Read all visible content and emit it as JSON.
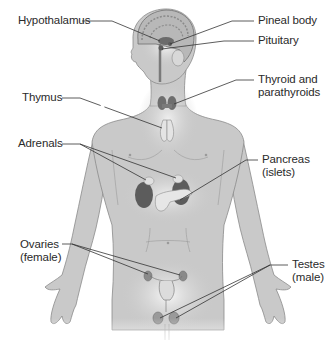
{
  "diagram": {
    "type": "anatomical-illustration",
    "colors": {
      "background": "#ffffff",
      "body_fill": "#c9c9c9",
      "body_stroke": "#8a8a8a",
      "glow": "#f2f2f2",
      "gland_dark": "#5c5c5c",
      "gland_light": "#dcdcdc",
      "leader_line": "#333333",
      "label_text": "#2a2a2a"
    },
    "labels": {
      "hypothalamus": {
        "lines": [
          "Hypothalamus"
        ]
      },
      "pineal_body": {
        "lines": [
          "Pineal body"
        ]
      },
      "pituitary": {
        "lines": [
          "Pituitary"
        ]
      },
      "thyroid": {
        "lines": [
          "Thyroid and",
          "parathyroids"
        ]
      },
      "thymus": {
        "lines": [
          "Thymus"
        ]
      },
      "adrenals": {
        "lines": [
          "Adrenals"
        ]
      },
      "pancreas": {
        "lines": [
          "Pancreas",
          "(islets)"
        ]
      },
      "ovaries": {
        "lines": [
          "Ovaries",
          "(female)"
        ]
      },
      "testes": {
        "lines": [
          "Testes",
          "(male)"
        ]
      }
    }
  }
}
